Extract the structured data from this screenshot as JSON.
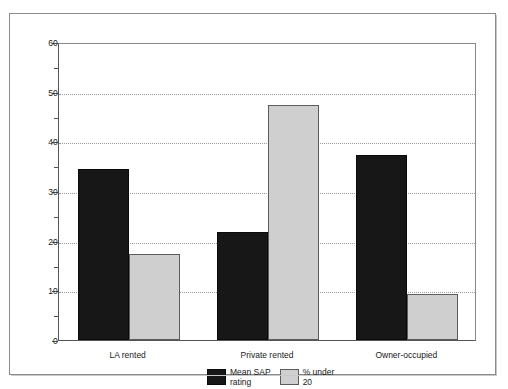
{
  "chart_data": {
    "type": "bar",
    "title": "",
    "xlabel": "",
    "ylabel": "",
    "categories": [
      "LA rented",
      "Private rented",
      "Owner-occupied"
    ],
    "series": [
      {
        "name": "Mean SAP\nrating",
        "legend_label": "Mean SAP\nrating",
        "color": "#171717",
        "values": [
          34.5,
          21.7,
          37.2
        ]
      },
      {
        "name": "% under\n20",
        "legend_label": "% under\n20",
        "color": "#cfcfcf",
        "values": [
          17.3,
          47.3,
          9.3
        ]
      }
    ],
    "ylim": [
      0,
      60
    ],
    "ytick_values": [
      0,
      10,
      20,
      30,
      40,
      50,
      60
    ],
    "ytick_labels": [
      "0",
      "10",
      "20",
      "30",
      "40",
      "50",
      "60"
    ],
    "yminor_tick_values": [
      5,
      15,
      25,
      35,
      45,
      55
    ],
    "gridlines": [
      10,
      20,
      30,
      40,
      50
    ],
    "grid": true,
    "grid_style": "dotted",
    "legend_position": "bottom-center"
  },
  "colors": {
    "series_dark": "#171717",
    "series_light": "#cfcfcf",
    "axis": "#555555",
    "grid": "#9a9a9a",
    "frame": "#8b8b8b",
    "background": "#ffffff"
  }
}
